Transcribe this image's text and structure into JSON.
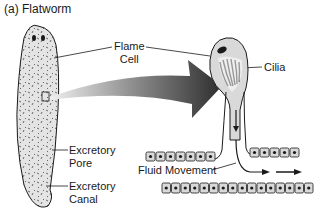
{
  "title": "(a) Flatworm",
  "labels": {
    "flame_cell_line1": "Flame",
    "flame_cell_line2": "Cell",
    "cilia": "Cilia",
    "excretory_pore_line1": "Excretory",
    "excretory_pore_line2": "Pore",
    "excretory_canal_line1": "Excretory",
    "excretory_canal_line2": "Canal",
    "fluid_movement": "Fluid Movement"
  },
  "colors": {
    "ink": "#1a1a1a",
    "cell_fill": "#d9d9d9",
    "arrow_dark": "#2e2e2e",
    "arrow_light": "#e6e6e6"
  }
}
